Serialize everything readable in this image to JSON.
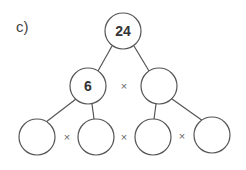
{
  "label": "c)",
  "colors": {
    "stroke": "#555555",
    "text": "#333333",
    "times": "#666666"
  },
  "tree": {
    "root": {
      "value": "24",
      "cx": 123,
      "cy": 31
    },
    "level1": [
      {
        "value": "6",
        "cx": 88,
        "cy": 86
      },
      {
        "value": "",
        "cx": 159,
        "cy": 86
      }
    ],
    "level1_operator": {
      "symbol": "×",
      "x": 124,
      "y": 86
    },
    "level2": [
      {
        "value": "",
        "cx": 37,
        "cy": 137
      },
      {
        "value": "",
        "cx": 95,
        "cy": 137
      },
      {
        "value": "",
        "cx": 154,
        "cy": 137
      },
      {
        "value": "",
        "cx": 212,
        "cy": 137
      }
    ],
    "level2_operators": [
      {
        "symbol": "×",
        "x": 67,
        "y": 137
      },
      {
        "symbol": "×",
        "x": 124,
        "y": 137
      },
      {
        "symbol": "×",
        "x": 182,
        "y": 137
      }
    ],
    "radius": 18
  }
}
